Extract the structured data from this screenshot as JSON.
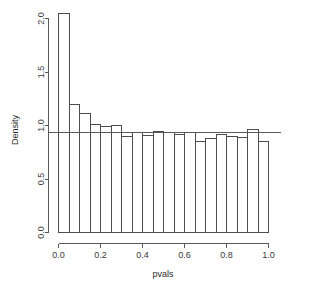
{
  "chart_data": {
    "type": "bar",
    "title": "",
    "subtitle": "",
    "xlabel": "pvals",
    "ylabel": "Density",
    "xlim": [
      0.0,
      1.0
    ],
    "ylim": [
      0.0,
      2.05
    ],
    "grid": false,
    "legend": null,
    "bin_width": 0.05,
    "categories": [
      "0.00-0.05",
      "0.05-0.10",
      "0.10-0.15",
      "0.15-0.20",
      "0.20-0.25",
      "0.25-0.30",
      "0.30-0.35",
      "0.35-0.40",
      "0.40-0.45",
      "0.45-0.50",
      "0.50-0.55",
      "0.55-0.60",
      "0.60-0.65",
      "0.65-0.70",
      "0.70-0.75",
      "0.75-0.80",
      "0.80-0.85",
      "0.85-0.90",
      "0.90-0.95",
      "0.95-1.00"
    ],
    "bin_edges": [
      0.0,
      0.05,
      0.1,
      0.15,
      0.2,
      0.25,
      0.3,
      0.35,
      0.4,
      0.45,
      0.5,
      0.55,
      0.6,
      0.65,
      0.7,
      0.75,
      0.8,
      0.85,
      0.9,
      0.95,
      1.0
    ],
    "values": [
      2.05,
      1.2,
      1.11,
      1.01,
      0.99,
      1.0,
      0.9,
      0.93,
      0.91,
      0.94,
      0.93,
      0.92,
      0.93,
      0.85,
      0.88,
      0.92,
      0.9,
      0.89,
      0.96,
      0.85
    ],
    "xticks": [
      0.0,
      0.2,
      0.4,
      0.6,
      0.8,
      1.0
    ],
    "xtick_labels": [
      "0.0",
      "0.2",
      "0.4",
      "0.6",
      "0.8",
      "1.0"
    ],
    "yticks": [
      0.0,
      0.5,
      1.0,
      1.5,
      2.0
    ],
    "ytick_labels": [
      "0.0",
      "0.5",
      "1.0",
      "1.5",
      "2.0"
    ],
    "annotations": [
      {
        "name": "uniform-reference-line",
        "type": "hline",
        "value": 0.93,
        "orientation": "horizontal"
      }
    ],
    "colors": {
      "bar_fill": "#ffffff",
      "bar_stroke": "#4d4d4d",
      "axis": "#5a5a5a",
      "text": "#2b2b2b",
      "reference_line": "#5a5a5a",
      "background": "#ffffff"
    }
  }
}
